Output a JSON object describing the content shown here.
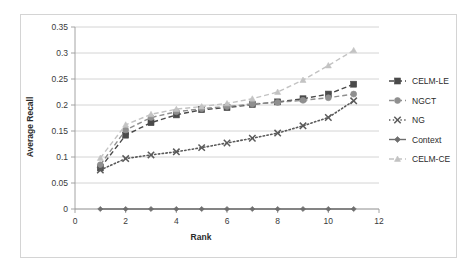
{
  "chart_data": {
    "type": "line",
    "title": "",
    "xlabel": "Rank",
    "ylabel": "Average Recall",
    "xlim": [
      0,
      12
    ],
    "ylim": [
      0,
      0.35
    ],
    "xticks": [
      0,
      2,
      4,
      6,
      8,
      10,
      12
    ],
    "xtick_labels": [
      "0",
      "2",
      "4",
      "6",
      "8",
      "10",
      "12"
    ],
    "yticks": [
      0,
      0.05,
      0.1,
      0.15,
      0.2,
      0.25,
      0.3,
      0.35
    ],
    "ytick_labels": [
      "0",
      "0.05",
      "0.1",
      "0.15",
      "0.2",
      "0.25",
      "0.3",
      "0.35"
    ],
    "grid": "horizontal",
    "legend_position": "right",
    "x": [
      1,
      2,
      3,
      4,
      5,
      6,
      7,
      8,
      9,
      10,
      11
    ],
    "series": [
      {
        "name": "CELM-LE",
        "color": "#4a4a4a",
        "marker": "square",
        "linestyle": "dashed",
        "values": [
          0.079,
          0.142,
          0.166,
          0.181,
          0.191,
          0.195,
          0.201,
          0.206,
          0.212,
          0.221,
          0.24
        ]
      },
      {
        "name": "NGCT",
        "color": "#8f8f8f",
        "marker": "circle",
        "linestyle": "dashed",
        "values": [
          0.085,
          0.152,
          0.176,
          0.187,
          0.193,
          0.197,
          0.202,
          0.205,
          0.209,
          0.214,
          0.221
        ]
      },
      {
        "name": "NG",
        "color": "#5a5a5a",
        "marker": "cross",
        "linestyle": "dotted",
        "values": [
          0.075,
          0.097,
          0.104,
          0.11,
          0.118,
          0.127,
          0.136,
          0.146,
          0.16,
          0.176,
          0.208
        ]
      },
      {
        "name": "Context",
        "color": "#6e6e6e",
        "marker": "diamond",
        "linestyle": "solid",
        "values": [
          0,
          0,
          0,
          0,
          0,
          0,
          0,
          0,
          0,
          0,
          0
        ]
      },
      {
        "name": "CELM-CE",
        "color": "#c3c3c3",
        "marker": "triangle",
        "linestyle": "dashed",
        "values": [
          0.098,
          0.162,
          0.182,
          0.192,
          0.197,
          0.203,
          0.212,
          0.225,
          0.248,
          0.276,
          0.305
        ]
      }
    ]
  },
  "legend": {
    "items": [
      {
        "label": "CELM-LE"
      },
      {
        "label": "NGCT"
      },
      {
        "label": "NG"
      },
      {
        "label": "Context"
      },
      {
        "label": "CELM-CE"
      }
    ]
  }
}
